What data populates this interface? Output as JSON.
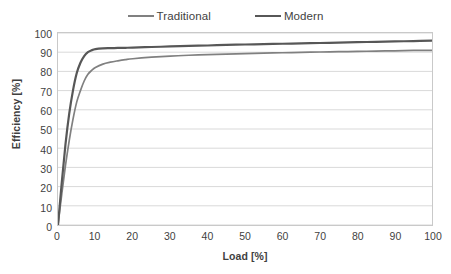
{
  "legend": {
    "position": "top-center",
    "entries": [
      {
        "label": "Traditional",
        "color": "#808080",
        "icon": "line-swatch-icon"
      },
      {
        "label": "Modern",
        "color": "#575757",
        "icon": "line-swatch-icon"
      }
    ]
  },
  "axes": {
    "x_title": "Load [%]",
    "y_title": "Efficiency [%]",
    "x_ticks": [
      "0",
      "10",
      "20",
      "30",
      "40",
      "50",
      "60",
      "70",
      "80",
      "90",
      "100"
    ],
    "y_ticks": [
      "100",
      "90",
      "80",
      "70",
      "60",
      "50",
      "40",
      "30",
      "20",
      "10",
      "0"
    ]
  },
  "colors": {
    "traditional": "#808080",
    "modern": "#575757",
    "gridline": "#d9d9d9",
    "axis_border": "#c9c9c9",
    "background": "#ffffff",
    "text": "#3f3f3f"
  },
  "chart_data": {
    "type": "line",
    "title": "",
    "subtitle": "",
    "xlabel": "Load [%]",
    "ylabel": "Efficiency [%]",
    "xlim": [
      0,
      100
    ],
    "ylim": [
      0,
      100
    ],
    "xtick_step": 10,
    "ytick_step": 10,
    "grid": "horizontal",
    "legend_position": "top-center",
    "x": [
      0,
      1,
      2,
      3,
      4,
      5,
      6,
      7,
      8,
      9,
      10,
      12,
      14,
      16,
      18,
      20,
      25,
      30,
      35,
      40,
      45,
      50,
      55,
      60,
      65,
      70,
      75,
      80,
      85,
      90,
      95,
      100
    ],
    "series": [
      {
        "name": "Traditional",
        "color": "#808080",
        "values": [
          0,
          16,
          31,
          44,
          55,
          64,
          70,
          75,
          78.5,
          80.5,
          82,
          83.8,
          84.8,
          85.5,
          86.1,
          86.6,
          87.4,
          88.0,
          88.4,
          88.7,
          89.0,
          89.3,
          89.5,
          89.7,
          89.9,
          90.1,
          90.3,
          90.4,
          90.6,
          90.7,
          90.9,
          91.0
        ]
      },
      {
        "name": "Modern",
        "color": "#575757",
        "values": [
          0,
          22,
          42,
          58,
          70,
          79,
          84.5,
          88,
          90,
          91,
          91.6,
          92.0,
          92.1,
          92.2,
          92.3,
          92.4,
          92.7,
          93.0,
          93.3,
          93.5,
          93.8,
          94.0,
          94.2,
          94.4,
          94.6,
          94.8,
          95.0,
          95.2,
          95.4,
          95.6,
          95.8,
          96.0
        ]
      }
    ],
    "annotations": []
  },
  "caption": {
    "partial_text": ""
  }
}
